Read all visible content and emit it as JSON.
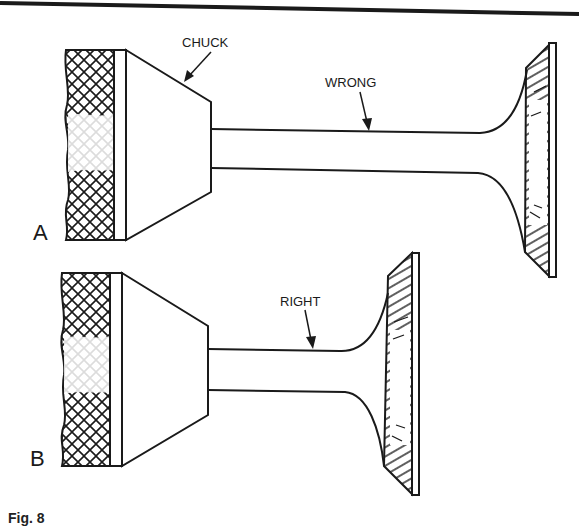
{
  "figure": {
    "caption_partial": "Fig. 8"
  },
  "panels": [
    {
      "id": "A",
      "label": "A",
      "callouts": [
        {
          "text": "CHUCK",
          "target": "chuck-face"
        },
        {
          "text": "WRONG",
          "target": "valve-stem"
        }
      ]
    },
    {
      "id": "B",
      "label": "B",
      "callouts": [
        {
          "text": "RIGHT",
          "target": "valve-stem"
        }
      ]
    }
  ],
  "colors": {
    "ink": "#1a1a1a",
    "paper": "#ffffff"
  }
}
